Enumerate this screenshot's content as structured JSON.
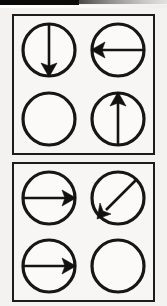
{
  "figure": {
    "background_color": "#f3f2f0",
    "ink_color": "#141414",
    "scan_artifact": {
      "name": "scanner-edge-bar",
      "black_bar_color": "#0a0a0a",
      "gray_bar_color": "#8f8f8f"
    },
    "panels": [
      {
        "id": "panel-top",
        "name": "top-panel",
        "rows": 2,
        "columns": 2,
        "cells": [
          {
            "id": "top-cell-1",
            "name": "circle-arrow-down",
            "position": "row1-col1",
            "arrow": true,
            "direction": "down",
            "angle_degrees": 270,
            "description": "circle with vertical arrow pointing down"
          },
          {
            "id": "top-cell-2",
            "name": "circle-arrow-left",
            "position": "row1-col2",
            "arrow": true,
            "direction": "left",
            "angle_degrees": 180,
            "description": "circle with horizontal arrow pointing left"
          },
          {
            "id": "top-cell-3",
            "name": "circle-empty",
            "position": "row2-col1",
            "arrow": false,
            "direction": "none",
            "angle_degrees": null,
            "description": "empty circle, no arrow"
          },
          {
            "id": "top-cell-4",
            "name": "circle-arrow-up",
            "position": "row2-col2",
            "arrow": true,
            "direction": "up",
            "angle_degrees": 90,
            "description": "circle with vertical arrow pointing up"
          }
        ]
      },
      {
        "id": "panel-bottom",
        "name": "bottom-panel",
        "rows": 2,
        "columns": 2,
        "cells": [
          {
            "id": "bottom-cell-1",
            "name": "circle-arrow-right",
            "position": "row1-col1",
            "arrow": true,
            "direction": "right",
            "angle_degrees": 0,
            "description": "circle with horizontal arrow pointing right"
          },
          {
            "id": "bottom-cell-2",
            "name": "circle-arrow-down-left",
            "position": "row1-col2",
            "arrow": true,
            "direction": "down-left",
            "angle_degrees": 225,
            "description": "circle with diagonal arrow pointing down-left"
          },
          {
            "id": "bottom-cell-3",
            "name": "circle-arrow-right",
            "position": "row2-col1",
            "arrow": true,
            "direction": "right",
            "angle_degrees": 0,
            "description": "circle with horizontal arrow pointing right"
          },
          {
            "id": "bottom-cell-4",
            "name": "circle-empty",
            "position": "row2-col2",
            "arrow": false,
            "direction": "none",
            "angle_degrees": null,
            "description": "empty circle, no arrow"
          }
        ]
      }
    ]
  }
}
